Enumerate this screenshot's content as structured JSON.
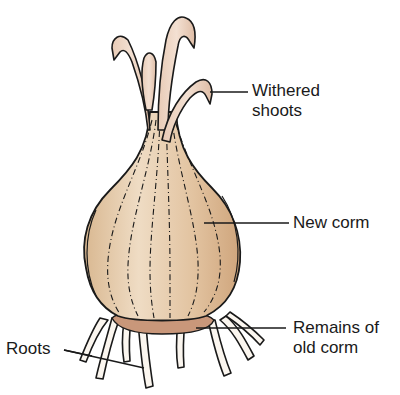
{
  "subject": "corm",
  "labels": {
    "withered_shoots": [
      "Withered",
      "shoots"
    ],
    "new_corm": "New corm",
    "remains_old_corm": [
      "Remains of",
      "old corm"
    ],
    "roots": "Roots"
  },
  "colors": {
    "corm_fill": "#e6c9a8",
    "corm_shade": "#d4ae86",
    "shoot_fill": "#ecd3c0",
    "old_corm_fill": "#c9977a",
    "root_fill": "#fbf6ef",
    "outline": "#1a1a1a",
    "text": "#1a1a1a"
  }
}
